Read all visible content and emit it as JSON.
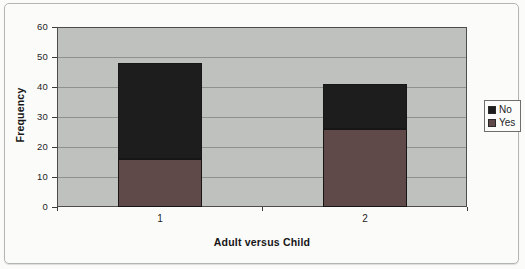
{
  "chart_data": {
    "type": "bar",
    "stacked": true,
    "title": "",
    "xlabel": "Adult versus Child",
    "ylabel": "Frequency",
    "categories": [
      "1",
      "2"
    ],
    "series": [
      {
        "name": "No",
        "values": [
          32,
          15
        ],
        "color": "#1d1d1d"
      },
      {
        "name": "Yes",
        "values": [
          16,
          26
        ],
        "color": "#5f4949"
      }
    ],
    "stack_totals": [
      48,
      41
    ],
    "ylim": [
      0,
      60
    ],
    "yticks": [
      0,
      10,
      20,
      30,
      40,
      50,
      60
    ],
    "ytick_interval": 10,
    "grid": "horizontal",
    "legend_position": "right",
    "colors": {
      "plot_background": "#bfc1bf",
      "gridline": "#8f918f",
      "bar_border": "#161616",
      "text": "#1c1c1c"
    }
  }
}
